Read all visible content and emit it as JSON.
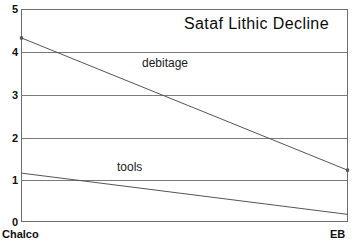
{
  "chart_data": {
    "type": "line",
    "title": "Sataf Lithic Decline",
    "xlabel": "",
    "ylabel": "",
    "categories": [
      "Chalco",
      "EB"
    ],
    "x": [
      0,
      1
    ],
    "xlim": [
      0,
      1
    ],
    "ylim": [
      0,
      5
    ],
    "yticks": [
      0,
      1,
      2,
      3,
      4,
      5
    ],
    "ytick_labels": [
      "0",
      "1",
      "2",
      "3",
      "4",
      "5"
    ],
    "xtick_labels": [
      "Chalco",
      "EB"
    ],
    "grid": "horizontal",
    "legend": "inline-annotations",
    "series": [
      {
        "name": "debitage",
        "values": [
          4.33,
          1.22
        ],
        "label": "debitage",
        "color": "#555555",
        "marker": "square"
      },
      {
        "name": "tools",
        "values": [
          1.15,
          0.18
        ],
        "label": "tools",
        "color": "#555555",
        "marker": "none"
      }
    ],
    "annotations": [
      {
        "text": "debitage",
        "x": 0.39,
        "y": 3.85
      },
      {
        "text": "tools",
        "x": 0.3,
        "y": 1.42
      }
    ]
  },
  "axes": {
    "y_ticks": [
      {
        "label": "5",
        "top": 4
      },
      {
        "label": "4",
        "top": 47
      },
      {
        "label": "3",
        "top": 90
      },
      {
        "label": "2",
        "top": 133
      },
      {
        "label": "1",
        "top": 175
      },
      {
        "label": "0",
        "top": 217
      }
    ],
    "gridlines": [
      52,
      95,
      138,
      180
    ],
    "x_labels": {
      "left": "Chalco",
      "right": "EB"
    }
  },
  "colors": {
    "frame": "#6e6e6e",
    "grid": "#7a7a7a",
    "line": "#555555",
    "text": "#101010",
    "background": "#ffffff"
  }
}
